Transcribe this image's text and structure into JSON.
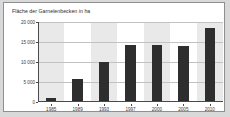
{
  "chart_data": {
    "type": "bar",
    "title": "Fläche der Garnelenbecken in ha",
    "xlabel": "",
    "ylabel": "",
    "categories": [
      "1985",
      "1989",
      "1993",
      "1997",
      "2000",
      "2005",
      "2010"
    ],
    "values": [
      750,
      5600,
      9700,
      13900,
      13900,
      13800,
      18200
    ],
    "ylim": [
      0,
      20000
    ],
    "yticks": [
      0,
      5000,
      10000,
      15000,
      20000
    ],
    "ytick_labels": [
      "0",
      "5 000",
      "10 000",
      "15 000",
      "20 000"
    ],
    "grid": true,
    "legend": false,
    "bar_color": "#2e2e2e",
    "band_color": "#e9e9e9",
    "grid_color": "#c2c2c2",
    "axis_color": "#4a4a4a",
    "background": "#ffffff",
    "frame_color": "#8f8f8f",
    "outer_background": "#d9d9d9"
  }
}
